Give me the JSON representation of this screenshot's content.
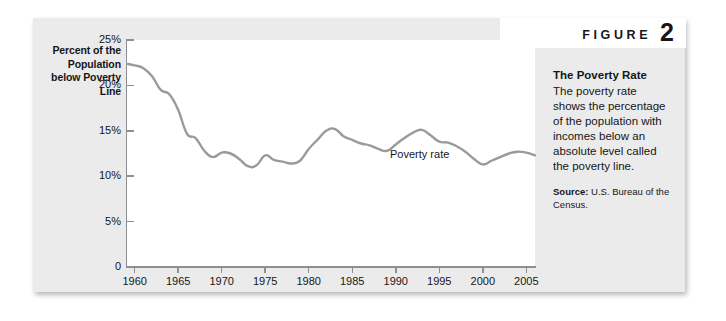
{
  "figure": {
    "word": "FIGURE",
    "number": "2"
  },
  "caption": {
    "title": "The Poverty Rate",
    "body": "The poverty rate shows the percentage of the population with incomes below an absolute level called the poverty line.",
    "source_label": "Source:",
    "source_text": " U.S. Bureau of the Census."
  },
  "colors": {
    "card_background": "#ebebeb",
    "plot_background": "#ffffff",
    "axis": "#8e8e93",
    "line": "#9a9a9a",
    "text": "#16161a"
  },
  "chart_data": {
    "type": "line",
    "title": "The Poverty Rate",
    "xlabel": "",
    "ylabel": "Percent of the Population below Poverty Line",
    "y_axis_title_lines": [
      "Percent of the",
      "Population",
      "below Poverty",
      "Line"
    ],
    "series_annotation": "Poverty rate",
    "grid": false,
    "legend": "none",
    "xlim": [
      1959,
      2006
    ],
    "ylim": [
      0,
      25
    ],
    "ytick_labels": [
      "25%",
      "20%",
      "15%",
      "10%",
      "5%",
      "0"
    ],
    "ytick_values": [
      25,
      20,
      15,
      10,
      5,
      0
    ],
    "xtick_labels": [
      "1960",
      "1965",
      "1970",
      "1975",
      "1980",
      "1985",
      "1990",
      "1995",
      "2000",
      "2005"
    ],
    "xtick_values": [
      1960,
      1965,
      1970,
      1975,
      1980,
      1985,
      1990,
      1995,
      2000,
      2005
    ],
    "series": [
      {
        "name": "Poverty rate",
        "x": [
          1959,
          1960,
          1961,
          1962,
          1963,
          1964,
          1965,
          1966,
          1967,
          1968,
          1969,
          1970,
          1971,
          1972,
          1973,
          1974,
          1975,
          1976,
          1977,
          1978,
          1979,
          1980,
          1981,
          1982,
          1983,
          1984,
          1985,
          1986,
          1987,
          1988,
          1989,
          1990,
          1991,
          1992,
          1993,
          1994,
          1995,
          1996,
          1997,
          1998,
          1999,
          2000,
          2001,
          2002,
          2003,
          2004,
          2005,
          2006
        ],
        "values": [
          22.4,
          22.2,
          21.9,
          21.0,
          19.5,
          19.0,
          17.3,
          14.7,
          14.2,
          12.8,
          12.1,
          12.6,
          12.5,
          11.9,
          11.1,
          11.2,
          12.3,
          11.8,
          11.6,
          11.4,
          11.7,
          13.0,
          14.0,
          15.0,
          15.2,
          14.4,
          14.0,
          13.6,
          13.4,
          13.0,
          12.8,
          13.5,
          14.2,
          14.8,
          15.1,
          14.5,
          13.8,
          13.7,
          13.3,
          12.7,
          11.9,
          11.3,
          11.7,
          12.1,
          12.5,
          12.7,
          12.6,
          12.3
        ]
      }
    ]
  }
}
